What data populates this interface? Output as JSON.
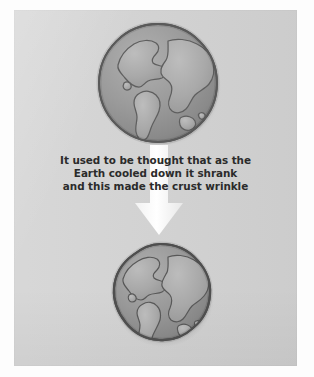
{
  "figure": {
    "name": "earth-shrinking-wrinkle-diagram",
    "background_color": "#ffffff",
    "panel_color": "#d3d3d3",
    "caption": {
      "lines": [
        "It used to be thought that as the",
        "Earth cooled down it shrank",
        "and this made the crust wrinkle"
      ],
      "text_color": "#2b2b2b"
    },
    "arrow": {
      "icon": "down-arrow-icon",
      "color": "#fbfbfb",
      "direction": "down"
    },
    "globes": [
      {
        "id": "globe-top",
        "label": "Earth before cooling (larger globe)",
        "ocean_color": "#9a9a9a",
        "land_color": "#a9a9a9",
        "outline_color": "#5a5a5a",
        "diameter_px": 126
      },
      {
        "id": "globe-bottom",
        "label": "Earth after cooling and shrinking (smaller wrinkled globe)",
        "ocean_color": "#9a9a9a",
        "land_color": "#a9a9a9",
        "outline_color": "#4f4f4f",
        "diameter_px": 110
      }
    ]
  }
}
